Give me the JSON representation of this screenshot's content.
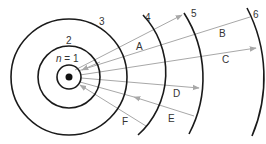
{
  "diagram": {
    "type": "bohr-model-energy-levels",
    "nucleus": {
      "label": "nucleus"
    },
    "levels": [
      {
        "n": "1",
        "label_prefix": "n",
        "label_eq": " = 1"
      },
      {
        "n": "2",
        "label": "2"
      },
      {
        "n": "3",
        "label": "3"
      },
      {
        "n": "4",
        "label": "4"
      },
      {
        "n": "5",
        "label": "5"
      },
      {
        "n": "6",
        "label": "6"
      }
    ],
    "transitions": [
      {
        "label": "A",
        "from": "1",
        "to": "5",
        "direction": "outward"
      },
      {
        "label": "B",
        "from": "1",
        "to": "6",
        "direction": "outward"
      },
      {
        "label": "C",
        "from": "1",
        "to": "6",
        "direction": "outward"
      },
      {
        "label": "D",
        "from": "1",
        "to": "5",
        "direction": "outward"
      },
      {
        "label": "E",
        "from": "5",
        "to": "1",
        "direction": "inward"
      },
      {
        "label": "F",
        "from": "4",
        "to": "1",
        "direction": "inward"
      }
    ],
    "colors": {
      "orbit": "#1a1a1a",
      "arrow": "#a8a8a8",
      "text": "#333333"
    }
  }
}
